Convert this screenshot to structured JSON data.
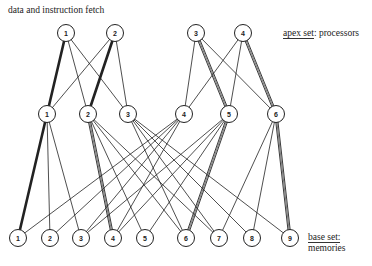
{
  "title_label": "data and instruction fetch",
  "apex_label": {
    "underlined": "apex set",
    "rest": ": processors"
  },
  "base_label": {
    "line1": "base set:",
    "line2": "memories"
  },
  "node_radius": 8.5,
  "apex_nodes": [
    {
      "id": "A1",
      "label": "1",
      "x": 66,
      "y": 33
    },
    {
      "id": "A2",
      "label": "2",
      "x": 115,
      "y": 33
    },
    {
      "id": "A3",
      "label": "3",
      "x": 196,
      "y": 33
    },
    {
      "id": "A4",
      "label": "4",
      "x": 243,
      "y": 33
    }
  ],
  "middle_nodes": [
    {
      "id": "M1",
      "label": "1",
      "x": 47,
      "y": 114
    },
    {
      "id": "M2",
      "label": "2",
      "x": 88,
      "y": 114
    },
    {
      "id": "M3",
      "label": "3",
      "x": 128,
      "y": 114
    },
    {
      "id": "M4",
      "label": "4",
      "x": 184,
      "y": 114
    },
    {
      "id": "M5",
      "label": "5",
      "x": 229,
      "y": 114
    },
    {
      "id": "M6",
      "label": "6",
      "x": 276,
      "y": 114
    }
  ],
  "base_nodes": [
    {
      "id": "B1",
      "label": "1",
      "x": 18,
      "y": 238
    },
    {
      "id": "B2",
      "label": "2",
      "x": 50,
      "y": 238
    },
    {
      "id": "B3",
      "label": "3",
      "x": 81,
      "y": 238
    },
    {
      "id": "B4",
      "label": "4",
      "x": 113,
      "y": 238
    },
    {
      "id": "B5",
      "label": "5",
      "x": 145,
      "y": 238
    },
    {
      "id": "B6",
      "label": "6",
      "x": 186,
      "y": 238
    },
    {
      "id": "B7",
      "label": "7",
      "x": 219,
      "y": 238
    },
    {
      "id": "B8",
      "label": "8",
      "x": 252,
      "y": 238
    },
    {
      "id": "B9",
      "label": "9",
      "x": 290,
      "y": 238
    }
  ],
  "edges": [
    {
      "from": "A1",
      "to": "M1",
      "style": "thick"
    },
    {
      "from": "A1",
      "to": "M2",
      "style": "thin"
    },
    {
      "from": "A1",
      "to": "M3",
      "style": "thin"
    },
    {
      "from": "A2",
      "to": "M1",
      "style": "thin"
    },
    {
      "from": "A2",
      "to": "M2",
      "style": "thick"
    },
    {
      "from": "A2",
      "to": "M3",
      "style": "thin"
    },
    {
      "from": "A3",
      "to": "M4",
      "style": "thin"
    },
    {
      "from": "A3",
      "to": "M5",
      "style": "double"
    },
    {
      "from": "A3",
      "to": "M6",
      "style": "thin"
    },
    {
      "from": "A4",
      "to": "M4",
      "style": "thin"
    },
    {
      "from": "A4",
      "to": "M5",
      "style": "thin"
    },
    {
      "from": "A4",
      "to": "M6",
      "style": "double"
    },
    {
      "from": "M1",
      "to": "B1",
      "style": "thick"
    },
    {
      "from": "M1",
      "to": "B2",
      "style": "thin"
    },
    {
      "from": "M1",
      "to": "B3",
      "style": "thin"
    },
    {
      "from": "M2",
      "to": "B4",
      "style": "double"
    },
    {
      "from": "M2",
      "to": "B5",
      "style": "thin"
    },
    {
      "from": "M2",
      "to": "B6",
      "style": "thin"
    },
    {
      "from": "M2",
      "to": "B7",
      "style": "thin"
    },
    {
      "from": "M3",
      "to": "B6",
      "style": "thin"
    },
    {
      "from": "M3",
      "to": "B7",
      "style": "thin"
    },
    {
      "from": "M3",
      "to": "B8",
      "style": "thin"
    },
    {
      "from": "M3",
      "to": "B9",
      "style": "thin"
    },
    {
      "from": "M4",
      "to": "B1",
      "style": "thin"
    },
    {
      "from": "M4",
      "to": "B2",
      "style": "thin"
    },
    {
      "from": "M4",
      "to": "B3",
      "style": "thin"
    },
    {
      "from": "M4",
      "to": "B4",
      "style": "thin"
    },
    {
      "from": "M5",
      "to": "B3",
      "style": "thin"
    },
    {
      "from": "M5",
      "to": "B4",
      "style": "thin"
    },
    {
      "from": "M5",
      "to": "B5",
      "style": "thin"
    },
    {
      "from": "M5",
      "to": "B6",
      "style": "double"
    },
    {
      "from": "M6",
      "to": "B7",
      "style": "thin"
    },
    {
      "from": "M6",
      "to": "B8",
      "style": "thin"
    },
    {
      "from": "M6",
      "to": "B9",
      "style": "double"
    }
  ],
  "colors": {
    "line": "#222222",
    "node_fill": "#ffffff",
    "background": "#ffffff"
  }
}
